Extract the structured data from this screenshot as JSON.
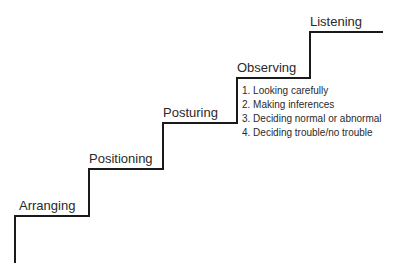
{
  "diagram": {
    "type": "staircase",
    "line_color": "#1a1a1a",
    "steps": [
      {
        "label": "Arranging"
      },
      {
        "label": "Positioning"
      },
      {
        "label": "Posturing"
      },
      {
        "label": "Observing"
      },
      {
        "label": "Listening"
      }
    ],
    "observing_substeps": [
      "1. Looking carefully",
      "2. Making inferences",
      "3. Deciding normal or abnormal",
      "4. Deciding trouble/no trouble"
    ]
  }
}
